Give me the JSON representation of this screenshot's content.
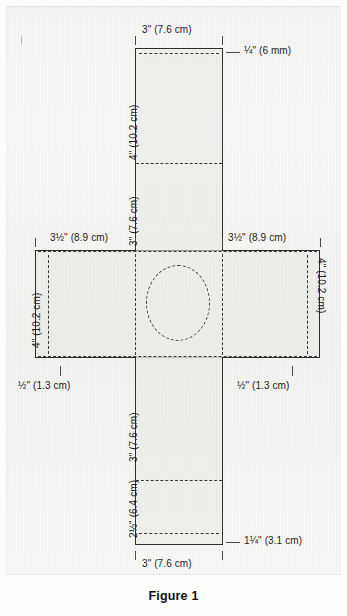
{
  "figure": {
    "caption": "Figure 1",
    "type": "sewing-pattern-cutting-diagram"
  },
  "dimensions": {
    "top_panel_width": "3\" (7.6 cm)",
    "top_hem_allowance": "¼\" (6 mm)",
    "top_panel_height": "4\" (10.2 cm)",
    "upper_center_height": "3\" (7.6 cm)",
    "middle_left_width": "3½\" (8.9 cm)",
    "middle_right_width": "3½\" (8.9 cm)",
    "middle_left_height": "4\" (10.2 cm)",
    "middle_right_height": "4\" (10.2 cm)",
    "seam_left": "½\" (1.3 cm)",
    "seam_right": "½\" (1.3 cm)",
    "lower_center_height": "3\" (7.6 cm)",
    "bottom_panel_height": "2½\" (6.4 cm)",
    "bottom_panel_width": "3\" (7.6 cm)",
    "bottom_hem_allowance": "1¼\" (3.1 cm)"
  },
  "elements": {
    "center_opening": "dashed-ellipse",
    "fold_lines": "dashed",
    "cut_lines": "solid"
  },
  "colors": {
    "paper": "#f7f7f5",
    "line": "#2e2e2e",
    "dash": "#3a3a3a",
    "text": "#1c1c1c"
  }
}
